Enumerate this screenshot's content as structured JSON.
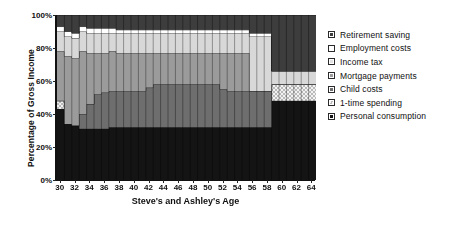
{
  "chart_data": {
    "type": "area",
    "title": "",
    "xlabel": "Steve's and Ashley's Age",
    "ylabel": "Percentage of Gross Income",
    "stacked": true,
    "stack_total": 100,
    "grid": false,
    "legend_position": "right",
    "xlim": [
      30,
      64
    ],
    "ylim": [
      0,
      100
    ],
    "y_ticks": [
      0,
      20,
      40,
      60,
      80,
      100
    ],
    "y_tick_labels": [
      "0%",
      "20%",
      "40%",
      "60%",
      "80%",
      "100%"
    ],
    "x": [
      30,
      31,
      32,
      33,
      34,
      35,
      36,
      37,
      38,
      39,
      40,
      41,
      42,
      43,
      44,
      45,
      46,
      47,
      48,
      49,
      50,
      51,
      52,
      53,
      54,
      55,
      56,
      57,
      58,
      59,
      60,
      61,
      62,
      63,
      64
    ],
    "x_tick_labels": [
      "30",
      "32",
      "34",
      "36",
      "38",
      "40",
      "42",
      "44",
      "46",
      "48",
      "50",
      "52",
      "54",
      "56",
      "58",
      "60",
      "62",
      "64"
    ],
    "x_tick_values": [
      30,
      32,
      34,
      36,
      38,
      40,
      42,
      44,
      46,
      48,
      50,
      52,
      54,
      56,
      58,
      60,
      62,
      64
    ],
    "series": [
      {
        "name": "Personal consumption",
        "color": "#141414",
        "pattern": "solid",
        "values": [
          43,
          34,
          33,
          31,
          31,
          31,
          31,
          32,
          32,
          32,
          32,
          32,
          32,
          32,
          32,
          32,
          32,
          32,
          32,
          32,
          32,
          32,
          32,
          32,
          32,
          32,
          32,
          32,
          32,
          48,
          48,
          48,
          48,
          48,
          48
        ]
      },
      {
        "name": "1-time spending",
        "color": "#b9b9b9",
        "pattern": "checker",
        "values": [
          5,
          0,
          0,
          0,
          0,
          0,
          0,
          0,
          0,
          0,
          0,
          0,
          0,
          0,
          0,
          0,
          0,
          0,
          0,
          0,
          0,
          0,
          0,
          0,
          0,
          0,
          0,
          0,
          0,
          10,
          10,
          10,
          10,
          10,
          10
        ]
      },
      {
        "name": "Child costs",
        "color": "#6e6e6e",
        "pattern": "solid",
        "values": [
          0,
          0,
          0,
          9,
          15,
          21,
          22,
          22,
          22,
          22,
          22,
          22,
          24,
          26,
          26,
          26,
          26,
          26,
          26,
          26,
          26,
          26,
          23,
          22,
          22,
          22,
          22,
          22,
          22,
          0,
          0,
          0,
          0,
          0,
          0
        ]
      },
      {
        "name": "Mortgage payments",
        "color": "#9b9b9b",
        "pattern": "solid",
        "values": [
          30,
          41,
          41,
          38,
          31,
          25,
          24,
          24,
          23,
          23,
          23,
          23,
          21,
          19,
          19,
          19,
          19,
          19,
          19,
          19,
          19,
          19,
          22,
          23,
          23,
          23,
          0,
          0,
          0,
          0,
          0,
          0,
          0,
          0,
          0
        ]
      },
      {
        "name": "Income tax",
        "color": "#d8d8d8",
        "pattern": "solid",
        "values": [
          12,
          12,
          12,
          12,
          12,
          12,
          12,
          11,
          12,
          12,
          12,
          12,
          12,
          12,
          12,
          12,
          12,
          12,
          12,
          12,
          12,
          12,
          12,
          12,
          12,
          12,
          33,
          33,
          33,
          8,
          8,
          8,
          8,
          8,
          8
        ]
      },
      {
        "name": "Employment costs",
        "color": "#ffffff",
        "pattern": "solid",
        "values": [
          3,
          3,
          3,
          3,
          3,
          3,
          3,
          3,
          2,
          2,
          2,
          2,
          2,
          2,
          2,
          2,
          2,
          2,
          2,
          2,
          2,
          2,
          2,
          2,
          2,
          2,
          2,
          2,
          2,
          0,
          0,
          0,
          0,
          0,
          0
        ]
      },
      {
        "name": "Retirement saving",
        "color": "#3d3d3d",
        "pattern": "solid",
        "values": [
          7,
          10,
          11,
          7,
          8,
          8,
          8,
          8,
          9,
          9,
          9,
          9,
          9,
          9,
          9,
          9,
          9,
          9,
          9,
          9,
          9,
          9,
          9,
          9,
          9,
          9,
          11,
          11,
          11,
          34,
          34,
          34,
          34,
          34,
          34
        ]
      }
    ],
    "legend": [
      {
        "label": "Retirement saving",
        "color": "#3d3d3d",
        "pattern": "solid"
      },
      {
        "label": "Employment costs",
        "color": "#ffffff",
        "pattern": "solid"
      },
      {
        "label": "Income tax",
        "color": "#e2e2e2",
        "pattern": "solid"
      },
      {
        "label": "Mortgage payments",
        "color": "#9b9b9b",
        "pattern": "solid"
      },
      {
        "label": "Child costs",
        "color": "#6e6e6e",
        "pattern": "solid"
      },
      {
        "label": "1-time spending",
        "color": "#b9b9b9",
        "pattern": "checker"
      },
      {
        "label": "Personal consumption",
        "color": "#141414",
        "pattern": "solid"
      }
    ]
  }
}
